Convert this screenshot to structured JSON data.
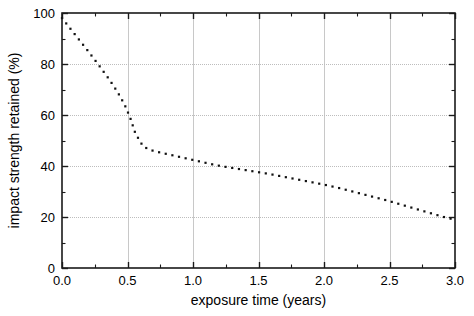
{
  "chart_data": {
    "type": "line",
    "title": "",
    "xlabel": "exposure time (years)",
    "ylabel": "impact strength retained (%)",
    "xlim": [
      0.0,
      3.0
    ],
    "ylim": [
      0,
      100
    ],
    "grid": true,
    "legend": null,
    "line_style": "dotted",
    "marker": "square-dot",
    "color": "#111111",
    "x_ticks": [
      0.0,
      0.5,
      1.0,
      1.5,
      2.0,
      2.5,
      3.0
    ],
    "x_tick_labels": [
      "0.0",
      "0.5",
      "1.0",
      "1.5",
      "2.0",
      "2.5",
      "3.0"
    ],
    "x_minor_ticks": [
      0.25,
      0.75,
      1.25,
      1.75,
      2.25,
      2.75
    ],
    "y_ticks": [
      0,
      20,
      40,
      60,
      80,
      100
    ],
    "y_tick_labels": [
      "0",
      "20",
      "40",
      "60",
      "80",
      "100"
    ],
    "y_minor_ticks": [
      10,
      30,
      50,
      70,
      90
    ],
    "series": [
      {
        "name": "impact strength retained",
        "x": [
          0.0,
          0.04,
          0.08,
          0.12,
          0.16,
          0.2,
          0.24,
          0.28,
          0.32,
          0.36,
          0.4,
          0.44,
          0.48,
          0.52,
          0.56,
          0.62,
          0.68,
          0.74,
          0.8,
          0.86,
          0.92,
          0.98,
          1.04,
          1.1,
          1.16,
          1.22,
          1.28,
          1.34,
          1.4,
          1.46,
          1.52,
          1.58,
          1.64,
          1.7,
          1.76,
          1.82,
          1.88,
          1.94,
          2.0,
          2.06,
          2.12,
          2.18,
          2.24,
          2.3,
          2.36,
          2.42,
          2.48,
          2.54,
          2.6,
          2.66,
          2.72,
          2.78,
          2.84,
          2.9,
          2.96,
          3.0
        ],
        "y": [
          98.0,
          95.4,
          92.8,
          90.2,
          87.6,
          85.0,
          82.3,
          79.6,
          76.8,
          74.0,
          70.9,
          67.6,
          63.8,
          59.0,
          52.8,
          47.6,
          46.2,
          45.4,
          44.7,
          44.0,
          43.3,
          42.6,
          41.9,
          41.2,
          40.5,
          39.9,
          39.4,
          38.9,
          38.4,
          37.9,
          37.4,
          36.9,
          36.3,
          35.7,
          35.1,
          34.5,
          33.9,
          33.3,
          32.7,
          32.0,
          31.3,
          30.5,
          29.7,
          28.9,
          28.1,
          27.3,
          26.5,
          25.6,
          24.7,
          23.8,
          22.9,
          22.0,
          21.1,
          20.2,
          19.4,
          19.0
        ]
      }
    ],
    "annotations": []
  }
}
